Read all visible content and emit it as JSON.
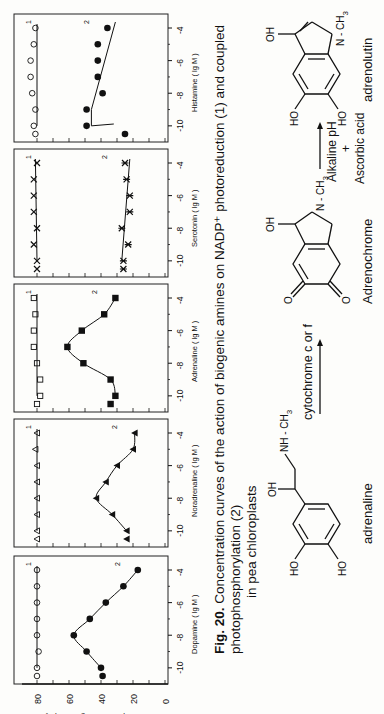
{
  "figure": {
    "label": "Fig. 20.",
    "caption_line1": "Concentration curves of the action of biogenic amines on NADP⁺ photoreduction (1) and coupled photophosphorylation (2)",
    "caption_line2": "in pea chloroplasts",
    "orientation": "rotated 90° counter-clockwise on page"
  },
  "chart_data": [
    {
      "type": "line",
      "title": "Dopamine",
      "xlabel": "Dopamine ( lg M )",
      "ylabel": "µmol h⁻¹ mg chlorophyll⁻¹",
      "x": [
        -10.5,
        -10,
        -9,
        -8,
        -7,
        -6,
        -5,
        -4
      ],
      "xticks": [
        -10,
        -8,
        -6,
        -4
      ],
      "ylim": [
        0,
        80
      ],
      "yticks": [
        0,
        20,
        40,
        60,
        80
      ],
      "series": [
        {
          "name": "1",
          "marker": "open-circle",
          "values": [
            80,
            80,
            79,
            80,
            80,
            80,
            80,
            80
          ]
        },
        {
          "name": "2",
          "marker": "filled-circle",
          "values": [
            39,
            40,
            49,
            57,
            47,
            37,
            26,
            17
          ]
        }
      ]
    },
    {
      "type": "line",
      "title": "Noradrenaline",
      "xlabel": "Noradrenaline ( lg M )",
      "ylabel": "µmol h⁻¹ mg chlorophyll⁻¹",
      "x": [
        -10.5,
        -10,
        -9,
        -8,
        -7,
        -6,
        -5,
        -4
      ],
      "xticks": [
        -10,
        -8,
        -6,
        -4
      ],
      "ylim": [
        0,
        80
      ],
      "yticks": [
        0,
        20,
        40,
        60,
        80
      ],
      "series": [
        {
          "name": "1",
          "marker": "open-triangle",
          "values": [
            80,
            80,
            80,
            80,
            80,
            80,
            81,
            80
          ]
        },
        {
          "name": "2",
          "marker": "filled-triangle",
          "values": [
            24,
            24,
            33,
            43,
            37,
            30,
            20,
            19
          ]
        }
      ]
    },
    {
      "type": "line",
      "title": "Adrenaline",
      "xlabel": "Adrenaline ( lg M )",
      "ylabel": "µmol h⁻¹ mg chlorophyll⁻¹",
      "x": [
        -10.5,
        -10,
        -9,
        -8,
        -7,
        -6,
        -5,
        -4
      ],
      "xticks": [
        -10,
        -8,
        -6,
        -4
      ],
      "ylim": [
        0,
        80
      ],
      "yticks": [
        0,
        20,
        40,
        60,
        80
      ],
      "series": [
        {
          "name": "1",
          "marker": "open-square",
          "values": [
            80,
            78,
            78,
            80,
            82,
            82,
            81,
            82
          ]
        },
        {
          "name": "2",
          "marker": "filled-square",
          "values": [
            34,
            31,
            34,
            51,
            61,
            52,
            38,
            31
          ]
        }
      ]
    },
    {
      "type": "line",
      "title": "Serotonin",
      "xlabel": "Serotonin ( lg M )",
      "ylabel": "µmol h⁻¹ mg chlorophyll⁻¹",
      "x": [
        -10.5,
        -10,
        -9,
        -8,
        -7,
        -6,
        -5,
        -4
      ],
      "xticks": [
        -10,
        -8,
        -6,
        -4
      ],
      "ylim": [
        0,
        80
      ],
      "yticks": [
        0,
        20,
        40,
        60,
        80
      ],
      "series": [
        {
          "name": "1",
          "marker": "cross",
          "values": [
            80,
            80,
            82,
            80,
            82,
            82,
            82,
            80
          ]
        },
        {
          "name": "2",
          "marker": "asterisk",
          "values": [
            26,
            26,
            23,
            27,
            22,
            22,
            24,
            25
          ]
        }
      ]
    },
    {
      "type": "line",
      "title": "Histamine",
      "xlabel": "Histamine ( lg M )",
      "ylabel": "µmol h⁻¹ mg chlorophyll⁻¹",
      "x": [
        -10.5,
        -10,
        -9,
        -8,
        -7,
        -6,
        -5,
        -4
      ],
      "xticks": [
        -10,
        -8,
        -6,
        -4
      ],
      "ylim": [
        0,
        80
      ],
      "yticks": [
        0,
        20,
        40,
        60,
        80
      ],
      "series": [
        {
          "name": "1",
          "marker": "open-circle",
          "values": [
            81,
            82,
            81,
            83,
            84,
            84,
            82,
            81
          ]
        },
        {
          "name": "2",
          "marker": "filled-circle",
          "values": [
            25,
            49,
            49,
            39,
            42,
            42,
            42,
            36
          ]
        }
      ]
    }
  ],
  "axis": {
    "ylabel": "µmol h⁻¹ mg chlorophyll⁻¹",
    "yticks": [
      "80",
      "60",
      "40",
      "20",
      "0"
    ],
    "xticks": [
      "-10",
      "-8",
      "-6",
      "-4"
    ],
    "unit": "( lg M )"
  },
  "scheme": {
    "compound1": "adrenaline",
    "compound2": "Adrenochrome",
    "compound3": "adrenolutin",
    "arrow1_label": "cytochrome c or f",
    "arrow2_label_top": "Alkaline pH",
    "arrow2_plus": "+",
    "arrow2_label_bottom": "Ascorbic acid",
    "atoms": {
      "oh": "OH",
      "ho": "HO",
      "o": "O",
      "nhch3": "NH - CH",
      "nch3": "N - CH",
      "sub3": "3"
    }
  }
}
